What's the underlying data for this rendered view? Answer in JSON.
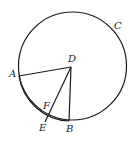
{
  "diagram": {
    "type": "geometry",
    "labels": {
      "C": "C",
      "D": "D",
      "A": "A",
      "F": "F",
      "E": "E",
      "B": "B"
    },
    "points": {
      "D": [
        71,
        67
      ],
      "A": [
        19,
        76
      ],
      "B": [
        69,
        121
      ],
      "E": [
        45,
        119
      ],
      "F": [
        49,
        109
      ]
    },
    "circle_C": {
      "cx": 72.5,
      "cy": 66,
      "r": 54
    },
    "segments": [
      "DA",
      "DE",
      "DB"
    ],
    "arcs": [
      "AB (centered at D)"
    ],
    "stroke_color": "#1a1a1a",
    "background": "#ffffff"
  }
}
